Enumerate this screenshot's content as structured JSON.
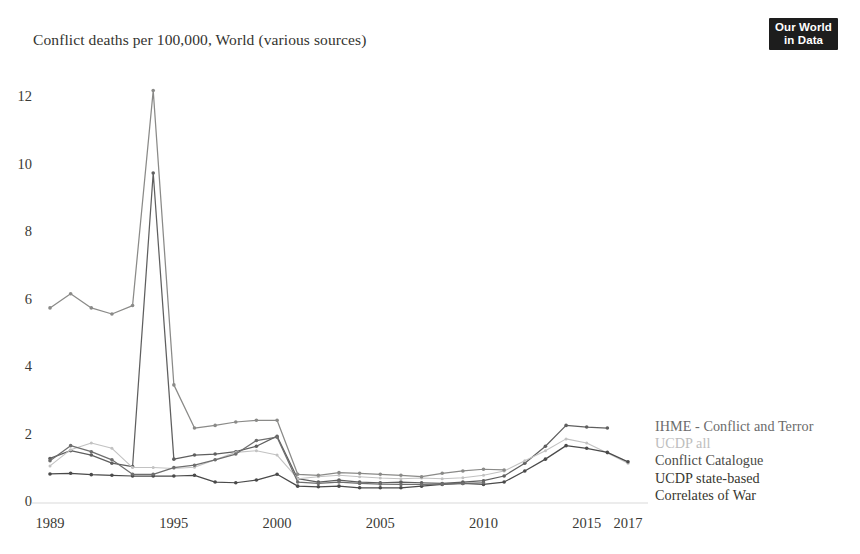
{
  "header": {
    "title": "Conflict deaths per 100,000, World (various sources)",
    "logo": {
      "line1": "Our World",
      "line2": "in Data"
    }
  },
  "chart_data": {
    "type": "line",
    "title": "Conflict deaths per 100,000, World (various sources)",
    "xlabel": "",
    "ylabel": "",
    "xlim": [
      1989,
      2017
    ],
    "ylim": [
      0,
      12.6
    ],
    "grid": false,
    "legend_position": "right",
    "x_ticks": [
      1989,
      1995,
      2000,
      2005,
      2010,
      2015,
      2017
    ],
    "y_ticks": [
      0,
      2,
      4,
      6,
      8,
      10,
      12
    ],
    "x": [
      1989,
      1990,
      1991,
      1992,
      1993,
      1994,
      1995,
      1996,
      1997,
      1998,
      1999,
      2000,
      2001,
      2002,
      2003,
      2004,
      2005,
      2006,
      2007,
      2008,
      2009,
      2010,
      2011,
      2012,
      2013,
      2014,
      2015,
      2016,
      2017
    ],
    "series": [
      {
        "name": "IHME - Conflict and Terror",
        "color": "#5f5f5f",
        "values": [
          1.32,
          1.55,
          1.42,
          1.18,
          1.08,
          9.78,
          1.3,
          1.42,
          1.45,
          1.52,
          1.68,
          1.98,
          0.72,
          0.62,
          0.68,
          0.62,
          0.6,
          0.62,
          0.6,
          0.58,
          0.62,
          0.66,
          0.8,
          1.18,
          1.68,
          2.3,
          2.25,
          2.22,
          null
        ]
      },
      {
        "name": "UCDP all",
        "color": "#c2c2c2",
        "values": [
          1.1,
          1.58,
          1.78,
          1.62,
          1.05,
          1.05,
          1.02,
          1.06,
          1.28,
          1.5,
          1.55,
          1.42,
          0.72,
          0.78,
          0.82,
          0.78,
          0.74,
          0.72,
          0.74,
          0.72,
          0.75,
          0.82,
          0.95,
          1.25,
          1.55,
          1.9,
          1.78,
          1.48,
          1.18
        ]
      },
      {
        "name": "Conflict Catalogue",
        "color": "#8a8a88",
        "values": [
          5.78,
          6.2,
          5.78,
          5.6,
          5.85,
          12.22,
          3.5,
          2.22,
          2.3,
          2.4,
          2.45,
          2.45,
          0.85,
          0.82,
          0.9,
          0.88,
          0.85,
          0.82,
          0.78,
          0.88,
          0.95,
          1.0,
          0.98,
          null,
          null,
          null,
          null,
          null,
          null
        ]
      },
      {
        "name": "UCDP state-based",
        "color": "#4a4a4a",
        "values": [
          0.86,
          0.88,
          0.84,
          0.82,
          0.8,
          0.8,
          0.8,
          0.82,
          0.62,
          0.6,
          0.68,
          0.85,
          0.5,
          0.48,
          0.5,
          0.45,
          0.45,
          0.45,
          0.5,
          0.55,
          0.58,
          0.55,
          0.62,
          0.95,
          1.3,
          1.7,
          1.62,
          1.5,
          1.22
        ]
      },
      {
        "name": "Correlates of War",
        "color": "#6e6e6e",
        "values": [
          1.25,
          1.7,
          1.52,
          1.28,
          0.85,
          0.85,
          1.05,
          1.12,
          1.28,
          1.45,
          1.85,
          1.95,
          0.62,
          0.58,
          0.62,
          0.58,
          0.56,
          0.55,
          0.55,
          0.56,
          0.58,
          0.6,
          null,
          null,
          null,
          null,
          null,
          null,
          null
        ]
      }
    ]
  },
  "legend": {
    "entries": [
      {
        "label": "IHME - Conflict and Terror",
        "color": "#6b6b6b"
      },
      {
        "label": "UCDP all",
        "color": "#bdbdbd"
      },
      {
        "label": "Conflict Catalogue",
        "color": "#4a4a46"
      },
      {
        "label": "UCDP state-based",
        "color": "#37372f"
      },
      {
        "label": "Correlates of War",
        "color": "#37372f"
      }
    ]
  },
  "axes": {
    "y_tick_labels": [
      "12",
      "10",
      "8",
      "6",
      "4",
      "2",
      "0"
    ],
    "x_tick_labels": [
      "1989",
      "1995",
      "2000",
      "2005",
      "2010",
      "2015",
      "2017"
    ]
  }
}
